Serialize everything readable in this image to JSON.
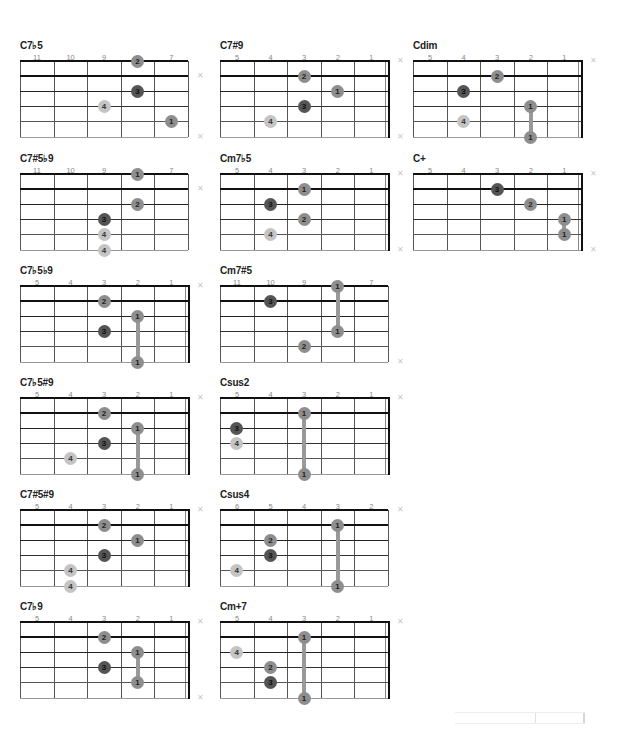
{
  "page": {
    "colors": {
      "finger1": "#8e8e8e",
      "finger2": "#8e8e8e",
      "finger3": "#555555",
      "finger4": "#c4c4c4",
      "barre": "#999999"
    }
  },
  "chords": [
    {
      "name": "C7♭5",
      "col": 0,
      "row": 0,
      "frets": [
        "11",
        "10",
        "9",
        "8",
        "7"
      ],
      "nut": false,
      "mutes": [
        1,
        5
      ],
      "dots": [
        {
          "s": 0,
          "f": 3,
          "n": "2"
        },
        {
          "s": 2,
          "f": 3,
          "n": "3"
        },
        {
          "s": 3,
          "f": 2,
          "n": "4"
        },
        {
          "s": 4,
          "f": 4,
          "n": "1"
        }
      ],
      "barres": []
    },
    {
      "name": "C7#9",
      "col": 1,
      "row": 0,
      "frets": [
        "5",
        "4",
        "3",
        "2",
        "1"
      ],
      "nut": true,
      "mutes": [
        0,
        5
      ],
      "dots": [
        {
          "s": 1,
          "f": 2,
          "n": "2"
        },
        {
          "s": 2,
          "f": 3,
          "n": "1"
        },
        {
          "s": 3,
          "f": 2,
          "n": "3"
        },
        {
          "s": 4,
          "f": 1,
          "n": "4"
        }
      ],
      "barres": []
    },
    {
      "name": "Cdim",
      "col": 2,
      "row": 0,
      "frets": [
        "5",
        "4",
        "3",
        "2",
        "1"
      ],
      "nut": true,
      "mutes": [
        0
      ],
      "dots": [
        {
          "s": 1,
          "f": 2,
          "n": "2"
        },
        {
          "s": 2,
          "f": 1,
          "n": "3"
        },
        {
          "s": 3,
          "f": 3,
          "n": "1"
        },
        {
          "s": 4,
          "f": 1,
          "n": "4"
        },
        {
          "s": 5,
          "f": 3,
          "n": "1"
        }
      ],
      "barres": [
        {
          "f": 3,
          "from": 3,
          "to": 5
        }
      ]
    },
    {
      "name": "C7#5♭9",
      "col": 0,
      "row": 1,
      "frets": [
        "11",
        "10",
        "9",
        "8",
        "7"
      ],
      "nut": false,
      "mutes": [
        1
      ],
      "dots": [
        {
          "s": 0,
          "f": 3,
          "n": "1"
        },
        {
          "s": 2,
          "f": 3,
          "n": "2"
        },
        {
          "s": 3,
          "f": 2,
          "n": "3"
        },
        {
          "s": 4,
          "f": 2,
          "n": "4"
        },
        {
          "s": 5,
          "f": 2,
          "n": "4"
        }
      ],
      "barres": []
    },
    {
      "name": "Cm7♭5",
      "col": 1,
      "row": 1,
      "frets": [
        "5",
        "4",
        "3",
        "2",
        "1"
      ],
      "nut": true,
      "mutes": [
        0,
        5
      ],
      "dots": [
        {
          "s": 1,
          "f": 2,
          "n": "1"
        },
        {
          "s": 2,
          "f": 1,
          "n": "3"
        },
        {
          "s": 3,
          "f": 2,
          "n": "2"
        },
        {
          "s": 4,
          "f": 1,
          "n": "4"
        }
      ],
      "barres": []
    },
    {
      "name": "C+",
      "col": 2,
      "row": 1,
      "frets": [
        "5",
        "4",
        "3",
        "2",
        "1"
      ],
      "nut": true,
      "mutes": [
        0,
        5
      ],
      "dots": [
        {
          "s": 1,
          "f": 2,
          "n": "3"
        },
        {
          "s": 2,
          "f": 3,
          "n": "2"
        },
        {
          "s": 3,
          "f": 4,
          "n": "1"
        },
        {
          "s": 4,
          "f": 4,
          "n": "1"
        }
      ],
      "barres": [
        {
          "f": 4,
          "from": 3,
          "to": 4
        }
      ]
    },
    {
      "name": "C7♭5♭9",
      "col": 0,
      "row": 2,
      "frets": [
        "5",
        "4",
        "3",
        "2",
        "1"
      ],
      "nut": true,
      "mutes": [
        0
      ],
      "dots": [
        {
          "s": 1,
          "f": 2,
          "n": "2"
        },
        {
          "s": 2,
          "f": 3,
          "n": "1"
        },
        {
          "s": 3,
          "f": 2,
          "n": "3"
        },
        {
          "s": 5,
          "f": 3,
          "n": "1"
        }
      ],
      "barres": [
        {
          "f": 3,
          "from": 2,
          "to": 5
        }
      ]
    },
    {
      "name": "Cm7#5",
      "col": 1,
      "row": 2,
      "frets": [
        "11",
        "10",
        "9",
        "8",
        "7"
      ],
      "nut": false,
      "mutes": [
        5
      ],
      "dots": [
        {
          "s": 0,
          "f": 3,
          "n": "1"
        },
        {
          "s": 1,
          "f": 1,
          "n": "3"
        },
        {
          "s": 3,
          "f": 3,
          "n": "1"
        },
        {
          "s": 4,
          "f": 2,
          "n": "2"
        }
      ],
      "barres": [
        {
          "f": 3,
          "from": 0,
          "to": 3
        }
      ]
    },
    {
      "name": "C7♭5#9",
      "col": 0,
      "row": 3,
      "frets": [
        "5",
        "4",
        "3",
        "2",
        "1"
      ],
      "nut": true,
      "mutes": [
        0
      ],
      "dots": [
        {
          "s": 1,
          "f": 2,
          "n": "2"
        },
        {
          "s": 2,
          "f": 3,
          "n": "1"
        },
        {
          "s": 3,
          "f": 2,
          "n": "3"
        },
        {
          "s": 4,
          "f": 1,
          "n": "4"
        },
        {
          "s": 5,
          "f": 3,
          "n": "1"
        }
      ],
      "barres": [
        {
          "f": 3,
          "from": 2,
          "to": 5
        }
      ]
    },
    {
      "name": "Csus2",
      "col": 1,
      "row": 3,
      "frets": [
        "5",
        "4",
        "3",
        "2",
        "1"
      ],
      "nut": true,
      "mutes": [
        0
      ],
      "dots": [
        {
          "s": 1,
          "f": 2,
          "n": "1"
        },
        {
          "s": 2,
          "f": 0,
          "n": "3"
        },
        {
          "s": 3,
          "f": 0,
          "n": "4"
        },
        {
          "s": 5,
          "f": 2,
          "n": "1"
        }
      ],
      "barres": [
        {
          "f": 2,
          "from": 1,
          "to": 5
        }
      ]
    },
    {
      "name": "C7#5#9",
      "col": 0,
      "row": 4,
      "frets": [
        "5",
        "4",
        "3",
        "2",
        "1"
      ],
      "nut": true,
      "mutes": [
        0
      ],
      "dots": [
        {
          "s": 1,
          "f": 2,
          "n": "2"
        },
        {
          "s": 2,
          "f": 3,
          "n": "1"
        },
        {
          "s": 3,
          "f": 2,
          "n": "3"
        },
        {
          "s": 4,
          "f": 1,
          "n": "4"
        },
        {
          "s": 5,
          "f": 1,
          "n": "4"
        }
      ],
      "barres": []
    },
    {
      "name": "Csus4",
      "col": 1,
      "row": 4,
      "frets": [
        "6",
        "5",
        "4",
        "3",
        "2"
      ],
      "nut": false,
      "mutes": [
        0
      ],
      "dots": [
        {
          "s": 1,
          "f": 3,
          "n": "1"
        },
        {
          "s": 2,
          "f": 1,
          "n": "2"
        },
        {
          "s": 3,
          "f": 1,
          "n": "3"
        },
        {
          "s": 4,
          "f": 0,
          "n": "4"
        },
        {
          "s": 5,
          "f": 3,
          "n": "1"
        }
      ],
      "barres": [
        {
          "f": 3,
          "from": 1,
          "to": 5
        }
      ]
    },
    {
      "name": "C7♭9",
      "col": 0,
      "row": 5,
      "frets": [
        "5",
        "4",
        "3",
        "2",
        "1"
      ],
      "nut": true,
      "mutes": [
        0,
        5
      ],
      "dots": [
        {
          "s": 1,
          "f": 2,
          "n": "2"
        },
        {
          "s": 2,
          "f": 3,
          "n": "1"
        },
        {
          "s": 3,
          "f": 2,
          "n": "3"
        },
        {
          "s": 4,
          "f": 3,
          "n": "1"
        }
      ],
      "barres": [
        {
          "f": 3,
          "from": 2,
          "to": 4
        }
      ]
    },
    {
      "name": "Cm+7",
      "col": 1,
      "row": 5,
      "frets": [
        "5",
        "4",
        "3",
        "2",
        "1"
      ],
      "nut": true,
      "mutes": [
        0
      ],
      "dots": [
        {
          "s": 1,
          "f": 2,
          "n": "1"
        },
        {
          "s": 2,
          "f": 0,
          "n": "4"
        },
        {
          "s": 3,
          "f": 1,
          "n": "2"
        },
        {
          "s": 4,
          "f": 1,
          "n": "3"
        },
        {
          "s": 5,
          "f": 2,
          "n": "1"
        }
      ],
      "barres": [
        {
          "f": 2,
          "from": 1,
          "to": 5
        }
      ]
    }
  ]
}
